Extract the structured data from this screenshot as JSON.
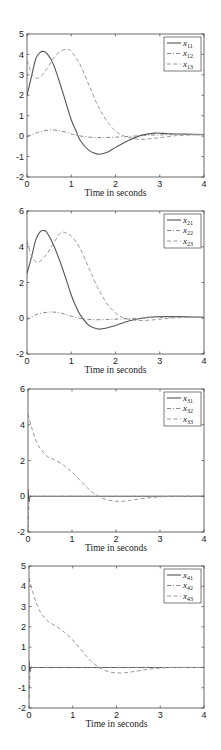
{
  "chart_data": [
    {
      "type": "line",
      "title": "",
      "xlabel": "Time in seconds",
      "ylabel": "",
      "xlim": [
        0,
        4
      ],
      "ylim": [
        -2,
        5
      ],
      "xticks": [
        0,
        1,
        2,
        3,
        4
      ],
      "yticks": [
        -2,
        -1,
        0,
        1,
        2,
        3,
        4,
        5
      ],
      "grid": false,
      "legend_position": "upper right",
      "series": [
        {
          "name": "x11",
          "label_main": "x",
          "label_sub": "11",
          "style": "solid",
          "x": [
            0,
            0.1,
            0.2,
            0.3,
            0.35,
            0.45,
            0.6,
            0.8,
            1.0,
            1.1,
            1.2,
            1.4,
            1.6,
            1.8,
            2.0,
            2.3,
            2.6,
            2.9,
            3.2,
            3.6,
            4.0
          ],
          "y": [
            2.0,
            2.9,
            3.8,
            4.1,
            4.15,
            4.05,
            3.5,
            2.2,
            0.8,
            0.3,
            -0.2,
            -0.7,
            -0.88,
            -0.8,
            -0.55,
            -0.2,
            0.05,
            0.15,
            0.12,
            0.1,
            0.08
          ]
        },
        {
          "name": "x12",
          "label_main": "x",
          "label_sub": "12",
          "style": "dashdot",
          "x": [
            0,
            0.1,
            0.2,
            0.35,
            0.5,
            0.7,
            0.9,
            1.1,
            1.4,
            1.7,
            2.0,
            2.4,
            2.8,
            3.2,
            3.6,
            4.0
          ],
          "y": [
            0.0,
            0.05,
            0.15,
            0.25,
            0.3,
            0.28,
            0.18,
            0.05,
            -0.05,
            -0.07,
            -0.05,
            0.0,
            0.05,
            0.07,
            0.07,
            0.06
          ]
        },
        {
          "name": "x13",
          "label_main": "x",
          "label_sub": "13",
          "style": "dashed",
          "x": [
            0,
            0.1,
            0.2,
            0.3,
            0.45,
            0.6,
            0.75,
            0.9,
            1.0,
            1.2,
            1.4,
            1.6,
            1.8,
            2.0,
            2.2,
            2.5,
            2.8,
            3.1,
            3.4,
            3.7,
            4.0
          ],
          "y": [
            3.7,
            3.1,
            2.85,
            2.9,
            3.3,
            3.8,
            4.15,
            4.25,
            4.15,
            3.5,
            2.5,
            1.5,
            0.75,
            0.25,
            0.0,
            -0.15,
            -0.12,
            -0.05,
            0.03,
            0.06,
            0.07
          ]
        }
      ]
    },
    {
      "type": "line",
      "title": "",
      "xlabel": "Time in seconds",
      "ylabel": "",
      "xlim": [
        0,
        4
      ],
      "ylim": [
        -2,
        6
      ],
      "xticks": [
        0,
        1,
        2,
        3,
        4
      ],
      "yticks": [
        -2,
        0,
        2,
        4,
        6
      ],
      "grid": false,
      "legend_position": "upper right",
      "series": [
        {
          "name": "x21",
          "label_main": "x",
          "label_sub": "21",
          "style": "solid",
          "x": [
            0,
            0.1,
            0.2,
            0.3,
            0.38,
            0.45,
            0.6,
            0.8,
            1.0,
            1.1,
            1.2,
            1.4,
            1.6,
            1.8,
            2.0,
            2.3,
            2.6,
            2.9,
            3.2,
            3.6,
            4.0
          ],
          "y": [
            2.5,
            3.4,
            4.4,
            4.85,
            4.9,
            4.8,
            4.1,
            2.8,
            1.3,
            0.7,
            0.2,
            -0.4,
            -0.6,
            -0.55,
            -0.4,
            -0.15,
            0.0,
            0.08,
            0.1,
            0.08,
            0.06
          ]
        },
        {
          "name": "x22",
          "label_main": "x",
          "label_sub": "22",
          "style": "dashdot",
          "x": [
            0,
            0.1,
            0.2,
            0.35,
            0.55,
            0.75,
            0.95,
            1.2,
            1.5,
            1.8,
            2.1,
            2.5,
            2.9,
            3.3,
            3.7,
            4.0
          ],
          "y": [
            -0.1,
            0.05,
            0.2,
            0.3,
            0.35,
            0.3,
            0.15,
            0.0,
            -0.08,
            -0.07,
            -0.04,
            0.0,
            0.04,
            0.06,
            0.06,
            0.05
          ]
        },
        {
          "name": "x23",
          "label_main": "x",
          "label_sub": "23",
          "style": "dashed",
          "x": [
            0,
            0.1,
            0.2,
            0.3,
            0.45,
            0.6,
            0.75,
            0.85,
            1.0,
            1.2,
            1.4,
            1.6,
            1.8,
            2.0,
            2.2,
            2.5,
            2.8,
            3.1,
            3.4,
            3.7,
            4.0
          ],
          "y": [
            4.3,
            3.5,
            3.15,
            3.2,
            3.6,
            4.2,
            4.75,
            4.8,
            4.6,
            3.9,
            2.8,
            1.7,
            0.85,
            0.3,
            0.0,
            -0.12,
            -0.1,
            -0.03,
            0.03,
            0.06,
            0.06
          ]
        }
      ]
    },
    {
      "type": "line",
      "title": "",
      "xlabel": "Time in seconds",
      "ylabel": "",
      "xlim": [
        0,
        4
      ],
      "ylim": [
        -2,
        6
      ],
      "xticks": [
        0,
        1,
        2,
        3,
        4
      ],
      "yticks": [
        -2,
        0,
        2,
        4,
        6
      ],
      "grid": false,
      "legend_position": "upper right",
      "series": [
        {
          "name": "x31",
          "label_main": "x",
          "label_sub": "31",
          "style": "solid",
          "x": [
            0,
            0.02,
            0.05,
            0.1,
            0.5,
            1.0,
            2.0,
            3.0,
            4.0
          ],
          "y": [
            0.4,
            -0.3,
            0.0,
            0.0,
            0.0,
            0.0,
            0.0,
            0.0,
            0.0
          ]
        },
        {
          "name": "x32",
          "label_main": "x",
          "label_sub": "32",
          "style": "dashdot",
          "x": [
            0,
            0.02,
            0.04,
            0.1,
            0.5,
            1.0,
            2.0,
            3.0,
            4.0
          ],
          "y": [
            -1.8,
            -0.5,
            0.0,
            0.0,
            0.0,
            0.0,
            0.0,
            0.0,
            0.0
          ]
        },
        {
          "name": "x33",
          "label_main": "x",
          "label_sub": "33",
          "style": "dashed",
          "x": [
            0,
            0.1,
            0.2,
            0.3,
            0.45,
            0.6,
            0.8,
            1.0,
            1.2,
            1.4,
            1.6,
            1.8,
            2.0,
            2.2,
            2.4,
            2.7,
            3.0,
            3.3,
            3.6,
            4.0
          ],
          "y": [
            4.6,
            3.7,
            3.0,
            2.6,
            2.2,
            2.05,
            1.75,
            1.35,
            0.85,
            0.35,
            0.0,
            -0.2,
            -0.28,
            -0.27,
            -0.2,
            -0.1,
            -0.03,
            0.0,
            0.0,
            0.0
          ]
        }
      ]
    },
    {
      "type": "line",
      "title": "",
      "xlabel": "Time in seconds",
      "ylabel": "",
      "xlim": [
        0,
        4
      ],
      "ylim": [
        -2,
        5
      ],
      "xticks": [
        0,
        1,
        2,
        3,
        4
      ],
      "yticks": [
        -2,
        -1,
        0,
        1,
        2,
        3,
        4,
        5
      ],
      "grid": false,
      "legend_position": "upper right",
      "series": [
        {
          "name": "x41",
          "label_main": "x",
          "label_sub": "41",
          "style": "solid",
          "x": [
            0,
            0.02,
            0.05,
            0.1,
            0.5,
            1.0,
            2.0,
            3.0,
            4.0
          ],
          "y": [
            0.3,
            -0.2,
            0.0,
            0.0,
            0.0,
            0.0,
            0.0,
            0.0,
            0.0
          ]
        },
        {
          "name": "x42",
          "label_main": "x",
          "label_sub": "42",
          "style": "dashdot",
          "x": [
            0,
            0.02,
            0.04,
            0.1,
            0.5,
            1.0,
            2.0,
            3.0,
            4.0
          ],
          "y": [
            -1.5,
            -0.4,
            0.0,
            0.0,
            0.0,
            0.0,
            0.0,
            0.0,
            0.0
          ]
        },
        {
          "name": "x43",
          "label_main": "x",
          "label_sub": "43",
          "style": "dashed",
          "x": [
            0,
            0.1,
            0.2,
            0.3,
            0.45,
            0.6,
            0.8,
            1.0,
            1.2,
            1.4,
            1.6,
            1.8,
            2.0,
            2.2,
            2.4,
            2.7,
            3.0,
            3.3,
            3.6,
            4.0
          ],
          "y": [
            4.4,
            3.6,
            3.0,
            2.6,
            2.25,
            2.05,
            1.75,
            1.35,
            0.85,
            0.35,
            0.0,
            -0.2,
            -0.27,
            -0.26,
            -0.2,
            -0.1,
            -0.03,
            0.0,
            0.0,
            0.0
          ]
        }
      ]
    }
  ],
  "layout": {
    "frames": [
      {
        "left": 27,
        "right": 204,
        "top": 34,
        "bottom": 177
      },
      {
        "left": 27,
        "right": 204,
        "top": 211,
        "bottom": 354
      },
      {
        "left": 28,
        "right": 204,
        "top": 389,
        "bottom": 532
      },
      {
        "left": 29,
        "right": 204,
        "top": 566,
        "bottom": 708
      }
    ],
    "legend": {
      "width": 37,
      "height": 34
    },
    "colors": {
      "axis": "#444444",
      "solid": "#555555",
      "dashed": "#9a9a9a",
      "dashdot": "#8a8a8a"
    }
  }
}
